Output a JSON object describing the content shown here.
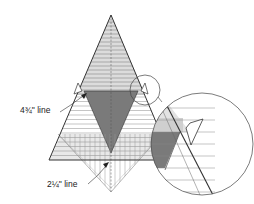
{
  "labels": {
    "upper_line": "4¾\" line",
    "lower_line": "2¼\" line"
  },
  "colors": {
    "outline": "#333333",
    "light_fill": "#e4e4e4",
    "mid_fill": "#cfcfcf",
    "dark_fill": "#7a7a7a",
    "ruler_line": "#888888",
    "background": "#ffffff"
  }
}
